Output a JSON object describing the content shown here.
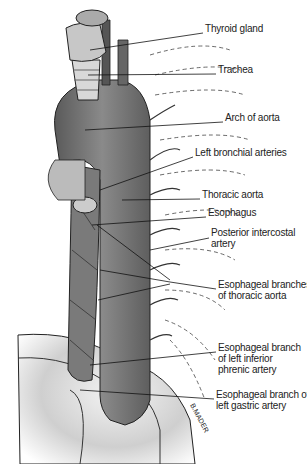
{
  "diagram": {
    "labels": [
      {
        "id": "thyroid",
        "text": "Thyroid gland",
        "x": 205,
        "y": 28
      },
      {
        "id": "trachea",
        "text": "Trachea",
        "x": 218,
        "y": 69
      },
      {
        "id": "arch",
        "text": "Arch of aorta",
        "x": 225,
        "y": 117
      },
      {
        "id": "bronchial",
        "text": "Left bronchial arteries",
        "x": 195,
        "y": 152
      },
      {
        "id": "thoracic",
        "text": "Thoracic aorta",
        "x": 202,
        "y": 194
      },
      {
        "id": "esophagus",
        "text": "Esophagus",
        "x": 208,
        "y": 212
      },
      {
        "id": "intercostal",
        "text": "Posterior intercostal",
        "text2": "artery",
        "x": 211,
        "y": 232
      },
      {
        "id": "esobranches",
        "text": "Esophageal branches",
        "text2": "of thoracic aorta",
        "x": 218,
        "y": 284
      },
      {
        "id": "phrenic",
        "text": "Esophageal branch",
        "text2": "of left inferior",
        "text3": "phrenic artery",
        "x": 218,
        "y": 347
      },
      {
        "id": "gastric",
        "text": "Esophageal branch of",
        "text2": "left gastric artery",
        "x": 216,
        "y": 394
      }
    ],
    "signature": "B.MADER"
  }
}
